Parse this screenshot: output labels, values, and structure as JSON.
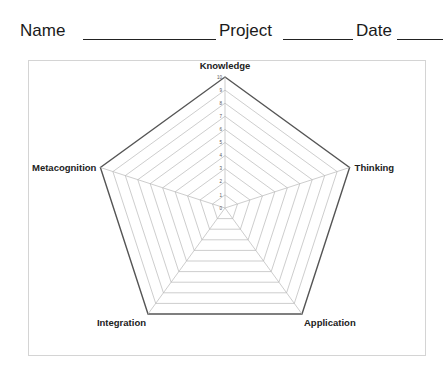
{
  "header": {
    "name_label": "Name",
    "name_value": "",
    "project_label": "Project",
    "project_value": "",
    "date_label": "Date",
    "date_value": ""
  },
  "chart_data": {
    "type": "radar",
    "title": "",
    "axes": [
      "Knowledge",
      "Thinking",
      "Application",
      "Integration",
      "Metacognition"
    ],
    "scale": {
      "min": 0,
      "max": 10,
      "step": 1
    },
    "tick_labels": [
      "0",
      "1",
      "2",
      "3",
      "4",
      "5",
      "6",
      "7",
      "8",
      "9",
      "10"
    ],
    "grid": true,
    "series": [],
    "legend": "none",
    "colors": {
      "outer_ring": "#555555",
      "grid": "#b8b8b8",
      "frame": "#d4d4d4"
    }
  }
}
